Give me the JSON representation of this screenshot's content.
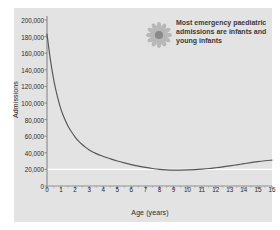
{
  "figure": {
    "panel_background": "#e3e3e3",
    "page_background": "#ffffff"
  },
  "annotation": {
    "text": "Most emergency paediatric admissions are infants and young infants",
    "icon": "flower-icon",
    "icon_petal_color": "#b8b8b8",
    "icon_center_color": "#8a8a8a",
    "text_color": "#3a3a3a"
  },
  "chart_data": {
    "type": "line",
    "title": "",
    "xlabel": "Age (years)",
    "ylabel": "Admissions",
    "xlim": [
      0,
      16
    ],
    "ylim": [
      0,
      200000
    ],
    "grid": false,
    "gridline_white_at": 20000,
    "legend": "none",
    "line_color": "#55555c",
    "axis_color": "#8f8f8f",
    "xticks": [
      0,
      1,
      2,
      3,
      4,
      5,
      6,
      7,
      8,
      9,
      10,
      11,
      12,
      13,
      14,
      15,
      16
    ],
    "xticklabels": [
      "0",
      "1",
      "2",
      "3",
      "4",
      "5",
      "6",
      "7",
      "8",
      "9",
      "10",
      "11",
      "12",
      "13",
      "14",
      "15",
      "16"
    ],
    "yticks": [
      0,
      20000,
      40000,
      60000,
      80000,
      100000,
      120000,
      140000,
      160000,
      180000,
      200000
    ],
    "yticklabels": [
      "0",
      "20,000",
      "40,000",
      "60,000",
      "80,000",
      "100,000",
      "120,000",
      "140,000",
      "160,000",
      "180,000",
      "200,000"
    ],
    "x": [
      0,
      0.25,
      0.5,
      0.75,
      1,
      1.25,
      1.5,
      1.75,
      2,
      2.25,
      2.5,
      2.75,
      3,
      3.25,
      3.5,
      3.75,
      4,
      4.5,
      5,
      5.5,
      6,
      6.5,
      7,
      7.5,
      8,
      8.5,
      9,
      9.5,
      10,
      10.5,
      11,
      11.5,
      12,
      12.5,
      13,
      13.5,
      14,
      14.5,
      15,
      15.5,
      16
    ],
    "values": [
      183000,
      151000,
      126000,
      107000,
      92000,
      81000,
      72000,
      65000,
      59000,
      54000,
      50000,
      46500,
      43500,
      41000,
      39000,
      37200,
      35600,
      32800,
      30200,
      27900,
      25800,
      24000,
      22400,
      21100,
      20100,
      19500,
      19200,
      19200,
      19400,
      19800,
      20400,
      21100,
      22000,
      23000,
      24200,
      25500,
      26900,
      28200,
      29400,
      30400,
      31200
    ],
    "series_name": "Emergency paediatric admissions"
  }
}
